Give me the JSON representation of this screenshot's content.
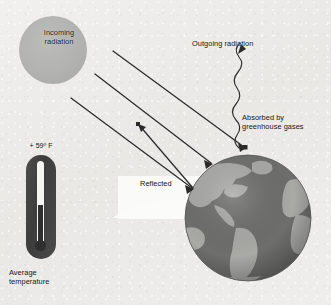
{
  "figure": {
    "background_color": "#ededeb"
  },
  "sun": {
    "label": "Incoming\nradiation",
    "color": "#b2b2b0"
  },
  "atmosphere": {
    "name": "atmosphere-wedge",
    "color": "#fbfbf9"
  },
  "earth": {
    "ocean_color": "#6b6b69",
    "land_color": "#a9a9a6",
    "label": "Earth"
  },
  "labels": {
    "outgoing": "Outgoing radiation",
    "absorbed": "Absorbed by\ngreenhouse gases",
    "reflected": "Reflected"
  },
  "thermometer": {
    "value": "+ 59º F",
    "caption": "Average\ntemperature",
    "body_color": "#434343",
    "mercury_color": "#2f2f2f",
    "tube_color": "#f4f4f2",
    "fill_percent": 45
  },
  "arrows": {
    "stroke_color": "#2a2a2a",
    "incoming_count": 3,
    "reflected_count": 1,
    "outgoing_wavy": true
  }
}
